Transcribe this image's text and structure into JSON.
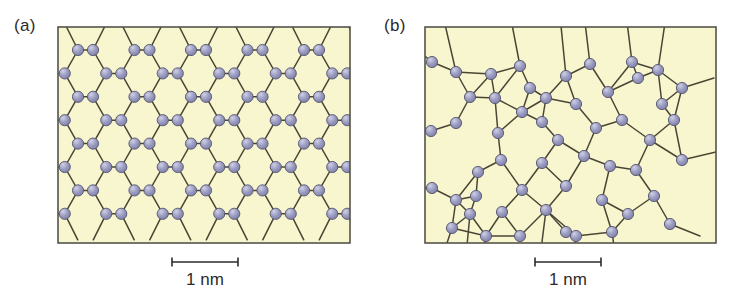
{
  "figure": {
    "type": "two-panel scientific diagram"
  },
  "colors": {
    "panel_background": "#f8f6cf",
    "panel_border": "#54544a",
    "bond_stroke": "#4a4535",
    "atom_fill": "#9a9bc0",
    "atom_edge": "#55556f",
    "atom_highlight": "#cfd0e6",
    "text": "#2b2b2b",
    "page_background": "#ffffff"
  },
  "panels": [
    {
      "id": "a",
      "label": "(a)",
      "structure": "crystalline",
      "frame": {
        "x": 58,
        "y": 27,
        "width": 292,
        "height": 216
      },
      "scalebar": {
        "label": "1 nm",
        "x_start": 172,
        "x_end": 238,
        "y": 262,
        "cap_height": 9
      }
    },
    {
      "id": "b",
      "label": "(b)",
      "structure": "amorphous",
      "frame": {
        "x": 55,
        "y": 27,
        "width": 291,
        "height": 216
      },
      "scalebar": {
        "label": "1 nm",
        "x_start": 165,
        "x_end": 231,
        "y": 262,
        "cap_height": 9
      }
    }
  ],
  "lattice_a": {
    "type": "hexagonal honeycomb",
    "atom_radius": 5.6,
    "row_spacing": 23.4,
    "rows_y": [
      50,
      73.4,
      96.8,
      120.2,
      143.6,
      167,
      190.4,
      213.8
    ],
    "col_pitch": 56.5,
    "cols_outer_x": [
      78,
      134.5,
      191,
      247.5,
      304
    ],
    "cols_inner_x": [
      93,
      149.5,
      206,
      262.5,
      319
    ],
    "pattern_note": "alternating rows offset by half pitch forming flat-top hexagons with horizontal bonds"
  },
  "lattice_b": {
    "type": "continuous random network",
    "atom_radius": 5.6,
    "nodes": [
      [
        62,
        62
      ],
      [
        86,
        72
      ],
      [
        100,
        97
      ],
      [
        86,
        123
      ],
      [
        61,
        131
      ],
      [
        62,
        188
      ],
      [
        86,
        200
      ],
      [
        82,
        228
      ],
      [
        100,
        214
      ],
      [
        125,
        98
      ],
      [
        121,
        74
      ],
      [
        150,
        66
      ],
      [
        160,
        88
      ],
      [
        152,
        112
      ],
      [
        128,
        133
      ],
      [
        131,
        160
      ],
      [
        108,
        172
      ],
      [
        106,
        196
      ],
      [
        132,
        212
      ],
      [
        152,
        190
      ],
      [
        176,
        98
      ],
      [
        172,
        122
      ],
      [
        196,
        76
      ],
      [
        206,
        104
      ],
      [
        188,
        140
      ],
      [
        172,
        163
      ],
      [
        196,
        186
      ],
      [
        176,
        210
      ],
      [
        150,
        236
      ],
      [
        196,
        232
      ],
      [
        220,
        64
      ],
      [
        238,
        92
      ],
      [
        226,
        128
      ],
      [
        214,
        156
      ],
      [
        240,
        166
      ],
      [
        232,
        200
      ],
      [
        258,
        214
      ],
      [
        252,
        120
      ],
      [
        268,
        78
      ],
      [
        262,
        62
      ],
      [
        288,
        70
      ],
      [
        292,
        104
      ],
      [
        280,
        140
      ],
      [
        266,
        170
      ],
      [
        284,
        196
      ],
      [
        300,
        224
      ],
      [
        312,
        160
      ],
      [
        304,
        120
      ],
      [
        312,
        88
      ],
      [
        242,
        232
      ],
      [
        206,
        236
      ],
      [
        116,
        236
      ]
    ],
    "bond_count_note": "each node bonds to 2-3 neighbours; rings of size 4,5,6,7 present",
    "edge_stubs_note": "bonds extend past frame edges on all four sides"
  },
  "scalebar": {
    "label": "1 nm"
  }
}
